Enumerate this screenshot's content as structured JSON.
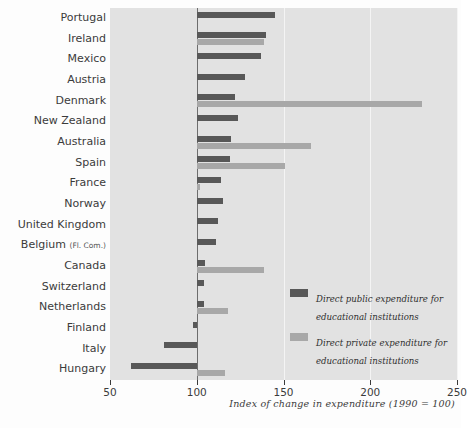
{
  "chart_data": {
    "type": "bar",
    "orientation": "horizontal",
    "title": "",
    "xlabel": "Index of change in expenditure (1990 = 100)",
    "ylabel": "",
    "xlim": [
      50,
      250
    ],
    "xticks": [
      50,
      100,
      150,
      200,
      250
    ],
    "baseline": 100,
    "grid": true,
    "legend_position": "inside-bottom-right",
    "categories": [
      "Portugal",
      "Ireland",
      "Mexico",
      "Austria",
      "Denmark",
      "New Zealand",
      "Australia",
      "Spain",
      "France",
      "Norway",
      "United Kingdom",
      "Belgium (Fl. Com.)",
      "Canada",
      "Switzerland",
      "Netherlands",
      "Finland",
      "Italy",
      "Hungary"
    ],
    "category_sublabels": {
      "Belgium (Fl. Com.)": {
        "main": "Belgium",
        "sub": "(Fl. Com.)"
      }
    },
    "series": [
      {
        "name": "Direct public expenditure for educational institutions",
        "color": "#585858",
        "values": [
          145,
          140,
          137,
          128,
          122,
          124,
          120,
          119,
          114,
          115,
          112,
          111,
          105,
          104,
          104,
          98,
          81,
          62
        ]
      },
      {
        "name": "Direct private expenditure for educational institutions",
        "color": "#a8a8a8",
        "values": [
          null,
          139,
          null,
          null,
          230,
          null,
          166,
          151,
          102,
          null,
          null,
          null,
          139,
          null,
          118,
          null,
          null,
          116
        ]
      }
    ]
  },
  "legend": {
    "items": [
      {
        "label": "Direct public expenditure for educational institutions",
        "color": "#585858"
      },
      {
        "label": "Direct private expenditure for educational institutions",
        "color": "#a8a8a8"
      }
    ]
  },
  "colors": {
    "public": "#585858",
    "private": "#a8a8a8",
    "plot_background": "#e2e2e2",
    "gridline": "#f4f4f4",
    "baseline": "#6d6d6d",
    "text": "#3b3b3b"
  }
}
